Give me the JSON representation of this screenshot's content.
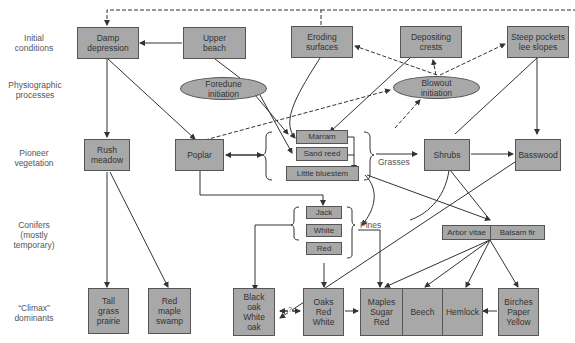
{
  "row_labels": {
    "initial": "Initial\nconditions",
    "physiographic": "Physiographic\nprocesses",
    "pioneer": "Pioneer\nvegetation",
    "conifers": "Conifers\n(mostly\ntemporary)",
    "climax": "“Climax”\ndominants"
  },
  "initial_conditions": {
    "damp_depression": "Damp\ndepression",
    "upper_beach": "Upper\nbeach",
    "eroding_surfaces": "Eroding\nsurfaces",
    "depositing_crests": "Depositing\ncrests",
    "steep_pockets": "Steep pockets\nlee slopes"
  },
  "processes": {
    "foredune": "Foredune\ninitiation",
    "blowout": "Blowout\ninitiation"
  },
  "pioneer": {
    "rush_meadow": "Rush\nmeadow",
    "poplar": "Poplar",
    "marram": "Marram",
    "sand_reed": "Sand reed",
    "little_bluestem": "Little bluestem",
    "grasses_label": "Grasses",
    "shrubs": "Shrubs",
    "basswood": "Basswood"
  },
  "conifers": {
    "jack": "Jack",
    "white": "White",
    "red": "Red",
    "pines_label": "Pines",
    "arbor_vitae": "Arbor vitae",
    "balsam_fir": "Balsam fir"
  },
  "climax": {
    "tall_grass": "Tall\ngrass\nprairie",
    "red_maple": "Red\nmaple\nswamp",
    "black_white_oak": "Black\noak\nWhite\noak",
    "question": "?",
    "oaks": "Oaks\nRed\nWhite",
    "maples": "Maples\nSugar\nRed",
    "beech": "Beech",
    "hemlock": "Hemlock",
    "birches": "Birches\nPaper\nYellow"
  },
  "colors": {
    "box_fill": "#a8a8a8",
    "box_border": "#555555",
    "line": "#333333",
    "label_text": "#555555"
  }
}
